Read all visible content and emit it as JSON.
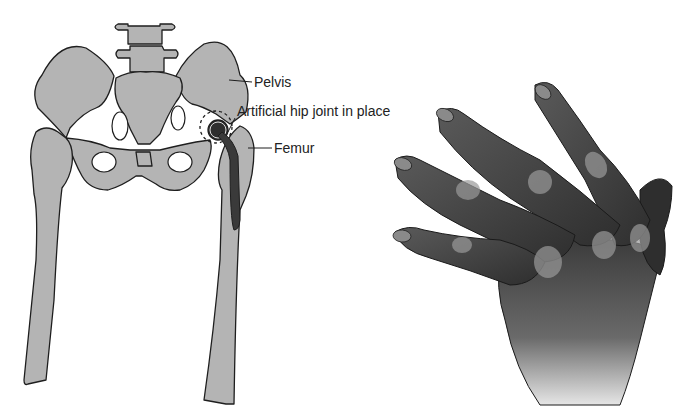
{
  "figure": {
    "hip_diagram": {
      "labels": {
        "pelvis": "Pelvis",
        "artificial_joint": "Artificial hip joint in place",
        "femur": "Femur"
      },
      "colors": {
        "bone": "#b4b4b4",
        "outline": "#1e1e1e",
        "implant": "#3a3a3a",
        "background": "#ffffff"
      }
    },
    "hand_illustration": {
      "description": "Arthritic hand with swollen knuckles and deformed fingers",
      "colors": {
        "skin_dark": "#2e2e2e",
        "skin_mid": "#6a6a6a",
        "skin_light": "#c8c8c8"
      }
    }
  }
}
